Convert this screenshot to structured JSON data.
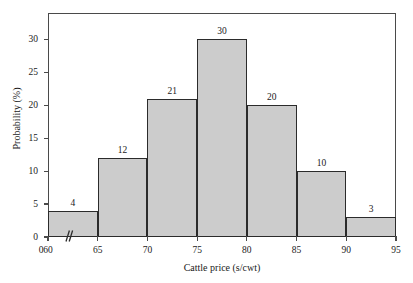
{
  "chart_data": {
    "type": "bar",
    "title": "",
    "subtitle": "",
    "xlabel": "Cattle price (s/cwt)",
    "ylabel": "Probability (%)",
    "categories": [
      "60-65",
      "65-70",
      "70-75",
      "75-80",
      "80-85",
      "85-90",
      "90-95"
    ],
    "bin_edges": [
      60,
      65,
      70,
      75,
      80,
      85,
      90,
      95
    ],
    "values": [
      4,
      12,
      21,
      30,
      20,
      10,
      3
    ],
    "data_labels": [
      "4",
      "12",
      "21",
      "30",
      "20",
      "10",
      "3"
    ],
    "xlim": [
      60,
      95
    ],
    "ylim": [
      0,
      34
    ],
    "xticks": [
      60,
      65,
      70,
      75,
      80,
      85,
      90,
      95
    ],
    "xtick_labels": [
      "60",
      "65",
      "70",
      "75",
      "80",
      "85",
      "90",
      "95"
    ],
    "yticks": [
      0,
      5,
      10,
      15,
      20,
      25,
      30
    ],
    "ytick_labels": [
      "0",
      "5",
      "10",
      "15",
      "20",
      "25",
      "30"
    ],
    "grid": false,
    "legend": false,
    "legend_position": "none",
    "axis_break": {
      "present": true,
      "axis": "x",
      "symbol": "//",
      "between": [
        0,
        60
      ]
    },
    "style": {
      "bar_fill": "#cccccc",
      "bar_edge": "#2b2b2b",
      "frame_color": "#4a4a4a",
      "background": "#ffffff",
      "text_color": "#1a1a1a"
    }
  }
}
